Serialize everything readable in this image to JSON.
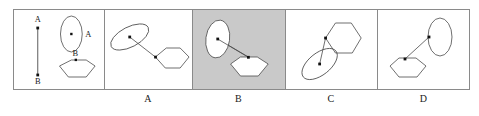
{
  "figure": {
    "type": "spatial-reasoning-multiple-choice",
    "background_color": "#ffffff",
    "border_color": "#8a8a8a",
    "shape_stroke_color": "#4a4a4a",
    "dot_color": "#111111",
    "highlight_color": "#c9c9c9"
  },
  "reference_panel": {
    "name": "reference",
    "vector": {
      "start_label": "A",
      "end_label": "B",
      "start_dot": true,
      "end_dot": true
    },
    "shapes": [
      {
        "kind": "ellipse",
        "label": "A",
        "label_position": "right",
        "dot": "center",
        "orientation": "upright"
      },
      {
        "kind": "hexagon",
        "label": "B",
        "label_position": "above",
        "dot": "top-edge",
        "orientation": "upright"
      }
    ]
  },
  "options": [
    {
      "label": "A",
      "selected": false,
      "background": "#ffffff",
      "shapes": [
        {
          "kind": "ellipse",
          "position": "upper-left",
          "rotation_deg": -27,
          "dot": "center"
        },
        {
          "kind": "hexagon",
          "position": "lower-right",
          "rotation_deg": 0,
          "dot": "left-vertex"
        }
      ],
      "connector": "ellipse-center-to-hexagon-vertex"
    },
    {
      "label": "B",
      "selected": true,
      "background": "#c9c9c9",
      "shapes": [
        {
          "kind": "ellipse",
          "position": "upper-left",
          "rotation_deg": 8,
          "dot": "center"
        },
        {
          "kind": "hexagon",
          "position": "lower-right",
          "rotation_deg": 0,
          "dot": "top-edge"
        }
      ],
      "connector": "ellipse-center-to-hexagon-top"
    },
    {
      "label": "C",
      "selected": false,
      "background": "#ffffff",
      "shapes": [
        {
          "kind": "hexagon",
          "position": "upper-right",
          "rotation_deg": 0,
          "dot": "lower-left-vertex"
        },
        {
          "kind": "ellipse",
          "position": "lower-left",
          "rotation_deg": -38,
          "dot": "center"
        }
      ],
      "connector": "hexagon-vertex-to-ellipse-center"
    },
    {
      "label": "D",
      "selected": false,
      "background": "#ffffff",
      "shapes": [
        {
          "kind": "ellipse",
          "position": "upper-right",
          "rotation_deg": 0,
          "dot": "left-edge"
        },
        {
          "kind": "hexagon",
          "position": "lower-left",
          "rotation_deg": 0,
          "dot": "top-edge"
        }
      ],
      "connector": "ellipse-edge-to-hexagon-top"
    }
  ]
}
